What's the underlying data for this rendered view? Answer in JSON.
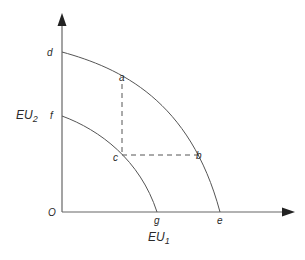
{
  "diagram": {
    "type": "utility-possibility-frontier",
    "colors": {
      "line": "#555555",
      "dashed": "#555555",
      "text": "#2a2a2a",
      "background": "#ffffff"
    },
    "axes": {
      "origin_label": "O",
      "x_label_main": "EU",
      "x_label_sub": "1",
      "y_label_main": "EU",
      "y_label_sub": "2"
    },
    "curves": [
      {
        "name": "outer-frontier",
        "from_label": "d",
        "to_label": "e"
      },
      {
        "name": "inner-frontier",
        "from_label": "f",
        "to_label": "g"
      }
    ],
    "points": {
      "a": "a",
      "b": "b",
      "c": "c",
      "d": "d",
      "e": "e",
      "f": "f",
      "g": "g"
    },
    "dashed_lines": [
      {
        "from": "a",
        "to": "c",
        "orientation": "vertical"
      },
      {
        "from": "c",
        "to": "b",
        "orientation": "horizontal"
      }
    ]
  }
}
